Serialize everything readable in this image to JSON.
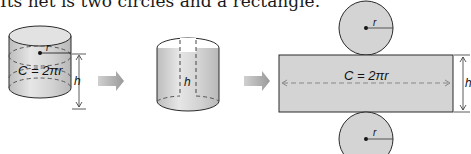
{
  "caption": "Its net is two circles and a rectangle.",
  "figure": {
    "cylinder": {
      "radius_label": "r",
      "circumference_label": "C = 2πr",
      "height_label": "h"
    },
    "cut_cylinder": {
      "height_label": "h"
    },
    "net": {
      "top_circle_radius_label": "r",
      "rectangle_label": "C = 2πr",
      "height_label": "h",
      "bottom_circle_radius_label": "r"
    },
    "colors": {
      "fill": "#d4d4d4",
      "stroke": "#2a2a2a",
      "arrow": "#a8a8a8",
      "dash": "#555555"
    }
  }
}
